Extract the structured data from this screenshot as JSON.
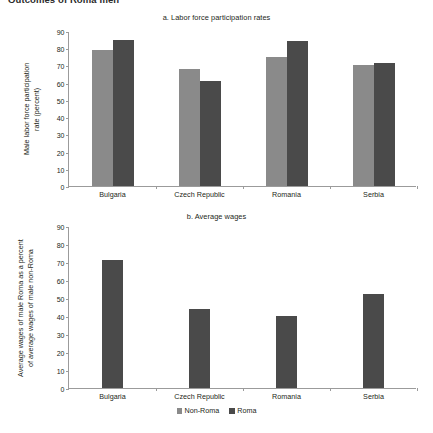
{
  "running_head": "Outcomes of Roma men",
  "legend": {
    "items": [
      {
        "label": "Non-Roma",
        "color": "#8a8a8a"
      },
      {
        "label": "Roma",
        "color": "#4a4a4a"
      }
    ]
  },
  "colors": {
    "non_roma": "#8a8a8a",
    "roma": "#4a4a4a",
    "axis": "#9b9b9b",
    "text": "#231f20",
    "background": "#ffffff"
  },
  "panel_a": {
    "title": "a. Labor force participation rates",
    "axis_title": "Male labor force participation\nrate (percent)",
    "yticks": [
      "90",
      "80",
      "70",
      "60",
      "50",
      "40",
      "30",
      "20",
      "10",
      "0"
    ],
    "categories": [
      "Bulgaria",
      "Czech Republic",
      "Romania",
      "Serbia"
    ]
  },
  "panel_b": {
    "title": "b. Average wages",
    "axis_title": "Average wages of male Roma as a percent\nof average wages of male non-Roma",
    "yticks": [
      "90",
      "80",
      "70",
      "60",
      "50",
      "40",
      "30",
      "20",
      "10",
      "0"
    ],
    "categories": [
      "Bulgaria",
      "Czech Republic",
      "Romania",
      "Serbia"
    ]
  },
  "chart_data": [
    {
      "type": "bar",
      "title": "a. Labor force participation rates",
      "xlabel": "",
      "ylabel": "Male labor force participation rate (percent)",
      "ylim": [
        0,
        90
      ],
      "ytick_step": 10,
      "grid": false,
      "legend_position": "bottom",
      "categories": [
        "Bulgaria",
        "Czech Republic",
        "Romania",
        "Serbia"
      ],
      "series": [
        {
          "name": "Non-Roma",
          "color": "#8a8a8a",
          "values": [
            79,
            68,
            75,
            70
          ]
        },
        {
          "name": "Roma",
          "color": "#4a4a4a",
          "values": [
            85,
            61,
            84,
            71.5
          ]
        }
      ]
    },
    {
      "type": "bar",
      "title": "b. Average wages",
      "xlabel": "",
      "ylabel": "Average wages of male Roma as a percent of average wages of male non-Roma",
      "ylim": [
        0,
        90
      ],
      "ytick_step": 10,
      "grid": false,
      "legend_position": "bottom",
      "categories": [
        "Bulgaria",
        "Czech Republic",
        "Romania",
        "Serbia"
      ],
      "series": [
        {
          "name": "Roma",
          "color": "#4a4a4a",
          "values": [
            71,
            44,
            40,
            52
          ]
        }
      ]
    }
  ]
}
